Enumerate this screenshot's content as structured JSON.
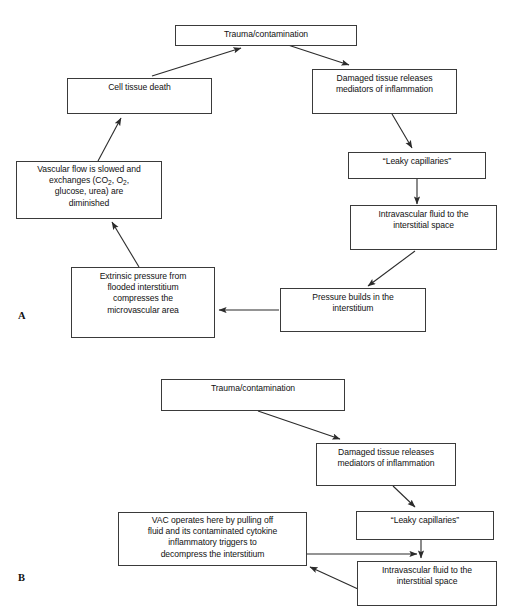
{
  "figure": {
    "type": "flowchart",
    "panels": [
      {
        "label": "A",
        "label_name": "panel-a-label",
        "caption": "Pathophysiology cycle of trauma/contamination leading to cell tissue death",
        "nodes": [
          {
            "id": "a-trauma",
            "text": "Trauma/contamination"
          },
          {
            "id": "a-celldeath",
            "text": "Cell tissue death"
          },
          {
            "id": "a-damaged",
            "text": "Damaged tissue releases mediators of inflammation"
          },
          {
            "id": "a-leaky",
            "text": "“Leaky capillaries”"
          },
          {
            "id": "a-intravasc",
            "text": "Intravascular fluid to the interstitial space"
          },
          {
            "id": "a-pressure",
            "text": "Pressure builds in the interstitium"
          },
          {
            "id": "a-extrinsic",
            "text": "Extrinsic pressure from flooded interstitium compresses the microvascular area"
          },
          {
            "id": "a-vascular",
            "text": "Vascular flow is slowed and exchanges (CO2, O2, glucose, urea) are diminished"
          }
        ],
        "edges": [
          {
            "from": "a-trauma",
            "to": "a-damaged"
          },
          {
            "from": "a-damaged",
            "to": "a-leaky"
          },
          {
            "from": "a-leaky",
            "to": "a-intravasc"
          },
          {
            "from": "a-intravasc",
            "to": "a-pressure"
          },
          {
            "from": "a-pressure",
            "to": "a-extrinsic"
          },
          {
            "from": "a-extrinsic",
            "to": "a-vascular"
          },
          {
            "from": "a-vascular",
            "to": "a-celldeath"
          },
          {
            "from": "a-celldeath",
            "to": "a-trauma"
          }
        ]
      },
      {
        "label": "B",
        "label_name": "panel-b-label",
        "caption": "VAC therapy interrupting the cycle at the interstitium",
        "nodes": [
          {
            "id": "b-trauma",
            "text": "Trauma/contamination"
          },
          {
            "id": "b-damaged",
            "text": "Damaged tissue releases mediators of inflammation"
          },
          {
            "id": "b-leaky",
            "text": "“Leaky capillaries”"
          },
          {
            "id": "b-intravasc",
            "text": "Intravascular fluid to the interstitial space"
          },
          {
            "id": "b-vac",
            "text": "VAC operates here by pulling off fluid and its contaminated cytokine inflammatory triggers to decompress the interstitium"
          }
        ],
        "edges": [
          {
            "from": "b-trauma",
            "to": "b-damaged"
          },
          {
            "from": "b-damaged",
            "to": "b-leaky"
          },
          {
            "from": "b-leaky",
            "to": "b-intravasc"
          },
          {
            "from": "b-vac",
            "to": "b-intravasc"
          },
          {
            "from": "b-intravasc",
            "to": "b-vac"
          }
        ]
      }
    ]
  },
  "a": {
    "trauma": {
      "line1": "Trauma/contamination"
    },
    "celldeath": {
      "line1": "Cell tissue death"
    },
    "damaged": {
      "line1": "Damaged tissue releases",
      "line2": "mediators of inflammation"
    },
    "leaky": {
      "line1": "“Leaky capillaries”"
    },
    "intravasc": {
      "line1": "Intravascular fluid to the",
      "line2": "interstitial space"
    },
    "pressure": {
      "line1": "Pressure builds in the",
      "line2": "interstitium"
    },
    "extrinsic": {
      "line1": "Extrinsic pressure from",
      "line2": "flooded interstitium",
      "line3": "compresses the",
      "line4": "microvascular area"
    },
    "vascular": {
      "line1": "Vascular flow is slowed and",
      "line2a": "exchanges (CO",
      "sub1": "2",
      "line2b": ", O",
      "sub2": "2",
      "line2c": ",",
      "line3": "glucose, urea) are",
      "line4": "diminished"
    }
  },
  "b": {
    "trauma": {
      "line1": "Trauma/contamination"
    },
    "damaged": {
      "line1": "Damaged tissue releases",
      "line2": "mediators of inflammation"
    },
    "leaky": {
      "line1": "“Leaky capillaries”"
    },
    "intravasc": {
      "line1": "Intravascular fluid to the",
      "line2": "interstitial space"
    },
    "vac": {
      "line1": "VAC operates here by pulling off",
      "line2": "fluid and its contaminated cytokine",
      "line3": "inflammatory triggers to",
      "line4": "decompress the interstitium"
    }
  },
  "labels": {
    "panel_a": "A",
    "panel_b": "B"
  },
  "colors": {
    "box_border": "#3a3a3a",
    "text": "#111111",
    "edge": "#2b2b2b",
    "background": "#ffffff"
  }
}
